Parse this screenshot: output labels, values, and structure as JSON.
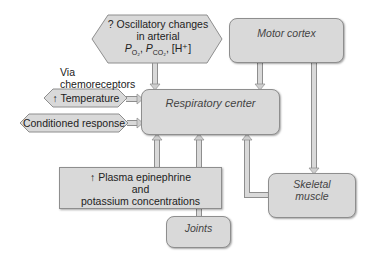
{
  "diagram": {
    "nodes": {
      "oscillatory": {
        "line1": "? Oscillatory changes",
        "line2": "in arterial",
        "line3_p": "P",
        "line3_o2": "O₂",
        "line3_sep": ", ",
        "line3_co2": "CO₂",
        "line3_h": ", [H⁺]"
      },
      "via_chemoreceptors": "Via chemoreceptors",
      "motor_cortex": "Motor cortex",
      "respiratory_center": "Respiratory center",
      "temperature": "↑ Temperature",
      "conditioned_response": "Conditioned response",
      "plasma": {
        "line1": "↑ Plasma epinephrine",
        "line2": "and",
        "line3": "potassium concentrations"
      },
      "joints": "Joints",
      "skeletal_muscle": {
        "line1": "Skeletal",
        "line2": "muscle"
      }
    },
    "colors": {
      "box_fill": "#d9d9d9",
      "box_border": "#8e8e8e",
      "arrow_fill": "#cfcfcf"
    }
  }
}
